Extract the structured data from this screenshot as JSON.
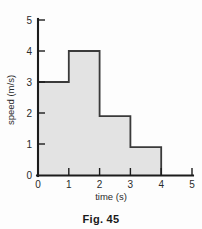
{
  "figure": {
    "caption": "Fig. 45"
  },
  "chart_data": {
    "type": "bar",
    "title": "",
    "subtitle": "",
    "xlabel": "time (s)",
    "ylabel": "speed (m/s)",
    "categories": [
      "0-1",
      "1-2",
      "2-3",
      "3-4"
    ],
    "x_intervals": [
      [
        0,
        1
      ],
      [
        1,
        2
      ],
      [
        2,
        3
      ],
      [
        3,
        4
      ]
    ],
    "values": [
      3,
      4,
      1.9,
      0.9
    ],
    "xlim": [
      0,
      5
    ],
    "ylim": [
      0,
      5
    ],
    "xticks": [
      0,
      1,
      2,
      3,
      4,
      5
    ],
    "yticks": [
      0,
      1,
      2,
      3,
      4,
      5
    ],
    "xtick_labels": [
      "0",
      "1",
      "2",
      "3",
      "4",
      "5"
    ],
    "ytick_labels": [
      "0",
      "1",
      "2",
      "3",
      "4",
      "5"
    ],
    "grid": false,
    "legend": null,
    "fill_color": "#e3e3e3",
    "line_color": "#3a3a3a",
    "axis_color": "#1c1c1c",
    "annotations": []
  }
}
